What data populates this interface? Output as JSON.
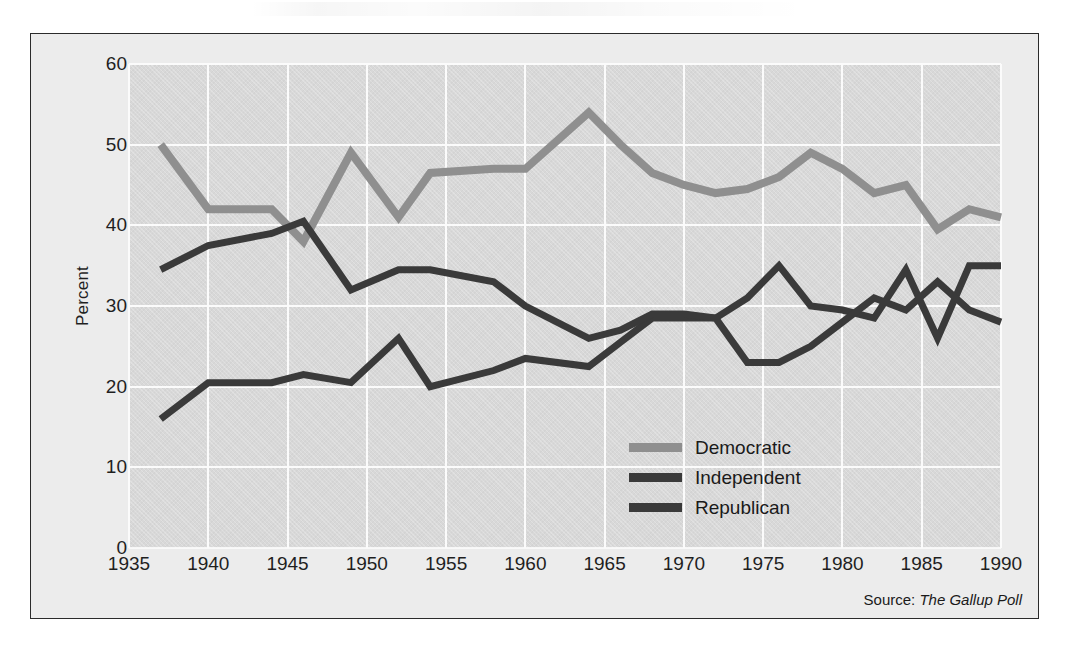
{
  "figure": {
    "y_axis_title": "Percent",
    "source_prefix": "Source:",
    "source_italic": "The Gallup Poll"
  },
  "legend": {
    "position": "inside-lower-right",
    "entries": [
      {
        "label": "Democratic",
        "color": "#8f8f8f"
      },
      {
        "label": "Independent",
        "color": "#3a3a3a"
      },
      {
        "label": "Republican",
        "color": "#3a3a3a"
      }
    ]
  },
  "chart_data": {
    "type": "line",
    "title": "",
    "subtitle": "",
    "xlabel": "",
    "ylabel": "Percent",
    "xlim": [
      1935,
      1990
    ],
    "ylim": [
      0,
      60
    ],
    "xticks": [
      1935,
      1940,
      1945,
      1950,
      1955,
      1960,
      1965,
      1970,
      1975,
      1980,
      1985,
      1990
    ],
    "yticks": [
      0,
      10,
      20,
      30,
      40,
      50,
      60
    ],
    "xtick_labels": [
      "1935",
      "1940",
      "1945",
      "1950",
      "1955",
      "1960",
      "1965",
      "1970",
      "1975",
      "1980",
      "1985",
      "1990"
    ],
    "ytick_labels": [
      "0",
      "10",
      "20",
      "30",
      "40",
      "50",
      "60"
    ],
    "grid": true,
    "grid_color": "#fbfbfb",
    "plot_background": "#d8d8d8",
    "legend_position": "inside-lower-right",
    "annotations": [
      "Source: The Gallup Poll"
    ],
    "series": [
      {
        "name": "Democratic",
        "color": "#8f8f8f",
        "x": [
          1937,
          1940,
          1944,
          1946,
          1949,
          1952,
          1954,
          1958,
          1960,
          1964,
          1966,
          1968,
          1970,
          1972,
          1974,
          1976,
          1978,
          1980,
          1982,
          1984,
          1986,
          1988,
          1990
        ],
        "values": [
          50,
          42,
          42,
          38,
          49,
          41,
          46.5,
          47,
          47,
          54,
          50,
          46.5,
          45,
          44,
          44.5,
          46,
          49,
          47,
          44,
          45,
          39.5,
          42,
          41
        ]
      },
      {
        "name": "Independent",
        "color": "#3a3a3a",
        "x": [
          1937,
          1940,
          1944,
          1946,
          1949,
          1952,
          1954,
          1958,
          1960,
          1964,
          1966,
          1968,
          1970,
          1972,
          1974,
          1976,
          1978,
          1980,
          1982,
          1984,
          1986,
          1988,
          1990
        ],
        "values": [
          16,
          20.5,
          20.5,
          21.5,
          20.5,
          26,
          20,
          22,
          23.5,
          22.5,
          25.5,
          28.5,
          28.5,
          28.5,
          31,
          35,
          30,
          29.5,
          28.5,
          34.5,
          26,
          35,
          35
        ]
      },
      {
        "name": "Republican",
        "color": "#3a3a3a",
        "x": [
          1937,
          1940,
          1944,
          1946,
          1949,
          1952,
          1954,
          1958,
          1960,
          1964,
          1966,
          1968,
          1970,
          1972,
          1974,
          1976,
          1978,
          1980,
          1982,
          1984,
          1986,
          1988,
          1990
        ],
        "values": [
          34.5,
          37.5,
          39,
          40.5,
          32,
          34.5,
          34.5,
          33,
          30,
          26,
          27,
          29,
          29,
          28.5,
          23,
          23,
          25,
          28,
          31,
          29.5,
          33,
          29.5,
          28
        ]
      }
    ]
  }
}
